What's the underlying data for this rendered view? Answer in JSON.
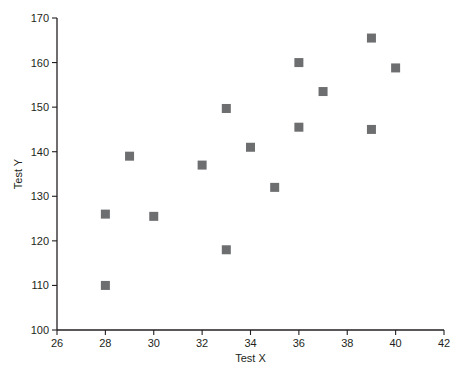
{
  "chart_data": {
    "type": "scatter",
    "title": "",
    "xlabel": "Test X",
    "ylabel": "Test Y",
    "xlim": [
      26,
      42
    ],
    "ylim": [
      100,
      170
    ],
    "xticks": [
      26,
      28,
      30,
      32,
      34,
      36,
      38,
      40,
      42
    ],
    "yticks": [
      100,
      110,
      120,
      130,
      140,
      150,
      160,
      170
    ],
    "grid": false,
    "legend": null,
    "marker_shape": "square",
    "marker_color": "#6d6e70",
    "axis_color": "#231f20",
    "background_color": "#ffffff",
    "series": [
      {
        "name": "points",
        "points": [
          {
            "x": 28,
            "y": 126.0
          },
          {
            "x": 28,
            "y": 110.0
          },
          {
            "x": 29,
            "y": 139.0
          },
          {
            "x": 30,
            "y": 125.5
          },
          {
            "x": 32,
            "y": 137.0
          },
          {
            "x": 33,
            "y": 149.7
          },
          {
            "x": 33,
            "y": 118.0
          },
          {
            "x": 34,
            "y": 141.0
          },
          {
            "x": 35,
            "y": 132.0
          },
          {
            "x": 36,
            "y": 160.0
          },
          {
            "x": 36,
            "y": 145.5
          },
          {
            "x": 37,
            "y": 153.5
          },
          {
            "x": 39,
            "y": 165.5
          },
          {
            "x": 39,
            "y": 145.0
          },
          {
            "x": 40,
            "y": 158.8
          }
        ]
      }
    ]
  },
  "plot_geometry": {
    "left": 57,
    "right": 444,
    "top": 18,
    "bottom": 330,
    "marker_size": 9,
    "tick_length": 5
  }
}
